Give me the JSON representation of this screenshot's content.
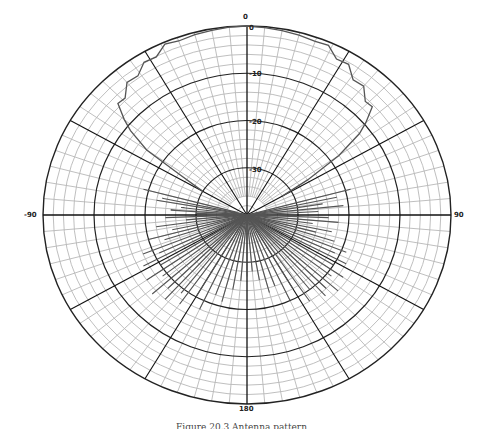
{
  "chart_data": {
    "type": "polar",
    "title": "",
    "caption": "Figure 20.3 Antenna pattern",
    "angular_unit": "degrees",
    "radial_unit": "dB",
    "angle_labels": [
      {
        "angle": 0,
        "text": "0"
      },
      {
        "angle": 90,
        "text": "90"
      },
      {
        "angle": -90,
        "text": "-90"
      },
      {
        "angle": 180,
        "text": "180"
      }
    ],
    "radial_ticks": [
      0,
      -10,
      -20,
      -30
    ],
    "radial_labels": [
      "0",
      "-10",
      "-20",
      "-30"
    ],
    "radial_range": [
      -40,
      0
    ],
    "major_spoke_step_deg": 30,
    "minor_spoke_step_deg": 5,
    "minor_ring_step_db": 2,
    "grid": true,
    "series": [
      {
        "name": "Main lobe",
        "points": [
          [
            -60,
            -30
          ],
          [
            -57,
            -24
          ],
          [
            -55,
            -16
          ],
          [
            -52,
            -11
          ],
          [
            -50,
            -8
          ],
          [
            -47,
            -6
          ],
          [
            -44,
            -5
          ],
          [
            -40,
            -4
          ],
          [
            -36,
            -3
          ],
          [
            -32,
            -2.5
          ],
          [
            -28,
            -1.5
          ],
          [
            -24,
            -1
          ],
          [
            -20,
            -0.8
          ],
          [
            -15,
            -0.5
          ],
          [
            -10,
            -0.3
          ],
          [
            -5,
            -0.1
          ],
          [
            0,
            0
          ],
          [
            5,
            -0.2
          ],
          [
            10,
            -0.4
          ],
          [
            15,
            -0.6
          ],
          [
            20,
            -0.9
          ],
          [
            24,
            -1.3
          ],
          [
            28,
            -2
          ],
          [
            32,
            -3
          ],
          [
            36,
            -4
          ],
          [
            40,
            -5
          ],
          [
            44,
            -6
          ],
          [
            47,
            -7
          ],
          [
            50,
            -9
          ],
          [
            52,
            -12
          ],
          [
            55,
            -18
          ],
          [
            58,
            -26
          ],
          [
            60,
            -32
          ]
        ]
      },
      {
        "name": "Side/back lobes",
        "spikes": [
          [
            -75,
            -19
          ],
          [
            -78,
            -23
          ],
          [
            -80,
            -22
          ],
          [
            -83,
            -27
          ],
          [
            -86,
            -25
          ],
          [
            -88,
            -30
          ],
          [
            -92,
            -24
          ],
          [
            -95,
            -28
          ],
          [
            -98,
            -22
          ],
          [
            -102,
            -25
          ],
          [
            -105,
            -20
          ],
          [
            -108,
            -23
          ],
          [
            -112,
            -18
          ],
          [
            -115,
            -21
          ],
          [
            -118,
            -17
          ],
          [
            -122,
            -20
          ],
          [
            -125,
            -16
          ],
          [
            -128,
            -19
          ],
          [
            -132,
            -15
          ],
          [
            -135,
            -18
          ],
          [
            -138,
            -16
          ],
          [
            -142,
            -19
          ],
          [
            -145,
            -17
          ],
          [
            -150,
            -20
          ],
          [
            -155,
            -18
          ],
          [
            -160,
            -22
          ],
          [
            -165,
            -21
          ],
          [
            -170,
            -24
          ],
          [
            -175,
            -26
          ],
          [
            75,
            -19
          ],
          [
            78,
            -22
          ],
          [
            81,
            -25
          ],
          [
            84,
            -21
          ],
          [
            87,
            -26
          ],
          [
            92,
            -24
          ],
          [
            95,
            -22
          ],
          [
            98,
            -27
          ],
          [
            102,
            -23
          ],
          [
            105,
            -26
          ],
          [
            108,
            -22
          ],
          [
            112,
            -19
          ],
          [
            115,
            -21
          ],
          [
            118,
            -18
          ],
          [
            122,
            -20
          ],
          [
            125,
            -17
          ],
          [
            128,
            -19
          ],
          [
            132,
            -16
          ],
          [
            135,
            -18
          ],
          [
            138,
            -17
          ],
          [
            142,
            -20
          ],
          [
            146,
            -18
          ],
          [
            150,
            -22
          ],
          [
            155,
            -20
          ],
          [
            160,
            -24
          ],
          [
            165,
            -23
          ],
          [
            170,
            -26
          ],
          [
            175,
            -28
          ],
          [
            180,
            -27
          ]
        ]
      }
    ]
  }
}
